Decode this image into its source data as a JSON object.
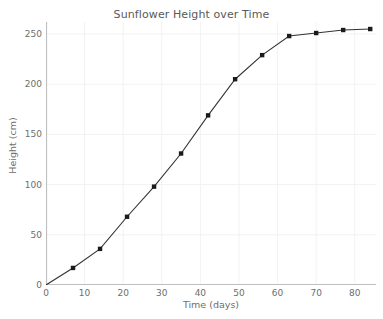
{
  "chart_data": {
    "type": "line",
    "title": "Sunflower Height over Time",
    "xlabel": "Time (days)",
    "ylabel": "Height (cm)",
    "x": [
      0,
      7,
      14,
      21,
      28,
      35,
      42,
      49,
      56,
      63,
      70,
      77,
      84
    ],
    "values": [
      0,
      17,
      36,
      68,
      98,
      131,
      169,
      205,
      229,
      248,
      251,
      254,
      255
    ],
    "series": [
      {
        "name": "Sunflower Height",
        "values": [
          0,
          17,
          36,
          68,
          98,
          131,
          169,
          205,
          229,
          248,
          251,
          254,
          255
        ]
      }
    ],
    "xlim": [
      0,
      85.5
    ],
    "ylim": [
      0,
      262
    ],
    "xticks": [
      0,
      10,
      20,
      30,
      40,
      50,
      60,
      70,
      80
    ],
    "yticks": [
      0,
      50,
      100,
      150,
      200,
      250
    ],
    "xtick_labels": [
      "0",
      "10",
      "20",
      "30",
      "40",
      "50",
      "60",
      "70",
      "80"
    ],
    "ytick_labels": [
      "0",
      "50",
      "100",
      "150",
      "200",
      "250"
    ],
    "grid": true,
    "legend": "none",
    "marker": "square",
    "line_color": "#333333",
    "marker_color": "#1a1a1a",
    "grid_color": "#f2f2f2",
    "axis_color": "#bfbfbf",
    "text_color": "#6e6e6e",
    "background_color": "#ffffff"
  }
}
